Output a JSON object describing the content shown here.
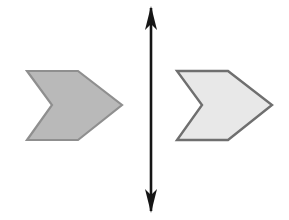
{
  "figure": {
    "background_color": "#ffffff",
    "canvas": {
      "width": 289,
      "height": 220
    }
  },
  "shapes": {
    "left_chevron": {
      "name": "left-chevron",
      "direction": "right",
      "fill_color": "#b9b9b9",
      "stroke_color": "#8f8f8f",
      "stroke_width": 2.2,
      "points": "27,71 78,71 122,105 78,140 27,140 52,105",
      "bbox": {
        "x": 27,
        "y": 71,
        "width": 95,
        "height": 69
      }
    },
    "right_chevron": {
      "name": "right-chevron",
      "direction": "right",
      "fill_color": "#e8e8e8",
      "stroke_color": "#6f6f6f",
      "stroke_width": 2.4,
      "points": "177,71 228,71 272,105 228,140 177,140 202,105",
      "bbox": {
        "x": 177,
        "y": 71,
        "width": 95,
        "height": 69
      }
    }
  },
  "axis": {
    "name": "vertical-double-arrow",
    "label": "axis of symmetry",
    "color": "#151515",
    "orientation": "vertical",
    "x": 151,
    "y_top": 6,
    "y_bottom": 213,
    "shaft_width": 2.6,
    "arrowhead": {
      "half_width": 6,
      "length": 22
    },
    "top_head_points": "151,6 157,30 151,24 145,30",
    "bottom_head_points": "151,213 145,189 151,195 157,189"
  }
}
